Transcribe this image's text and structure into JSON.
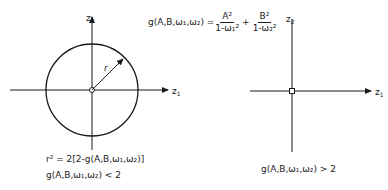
{
  "left_diagram": {
    "axis_x_label": "z",
    "axis_x_sub": "1",
    "axis_y_label": "z",
    "axis_y_sub": "2",
    "radius_label": "r",
    "equation_r": "r² = 2[2-g(A,B,ω₁,ω₂)]",
    "condition": "g(A,B,ω₁,ω₂) < 2"
  },
  "right_diagram": {
    "axis_x_label": "z",
    "axis_x_sub": "1",
    "axis_y_label": "z",
    "axis_y_sub": "2",
    "condition": "g(A,B,ω₁,ω₂) > 2"
  },
  "formula": {
    "lhs": "g(A,B,ω₁,ω₂) =",
    "term1_num": "A²",
    "term1_den": "1-ω₁²",
    "plus": "+",
    "term2_num": "B²",
    "term2_den": "1-ω₂²"
  },
  "colors": {
    "ink": "#1a1a1a",
    "background": "#ffffff"
  }
}
